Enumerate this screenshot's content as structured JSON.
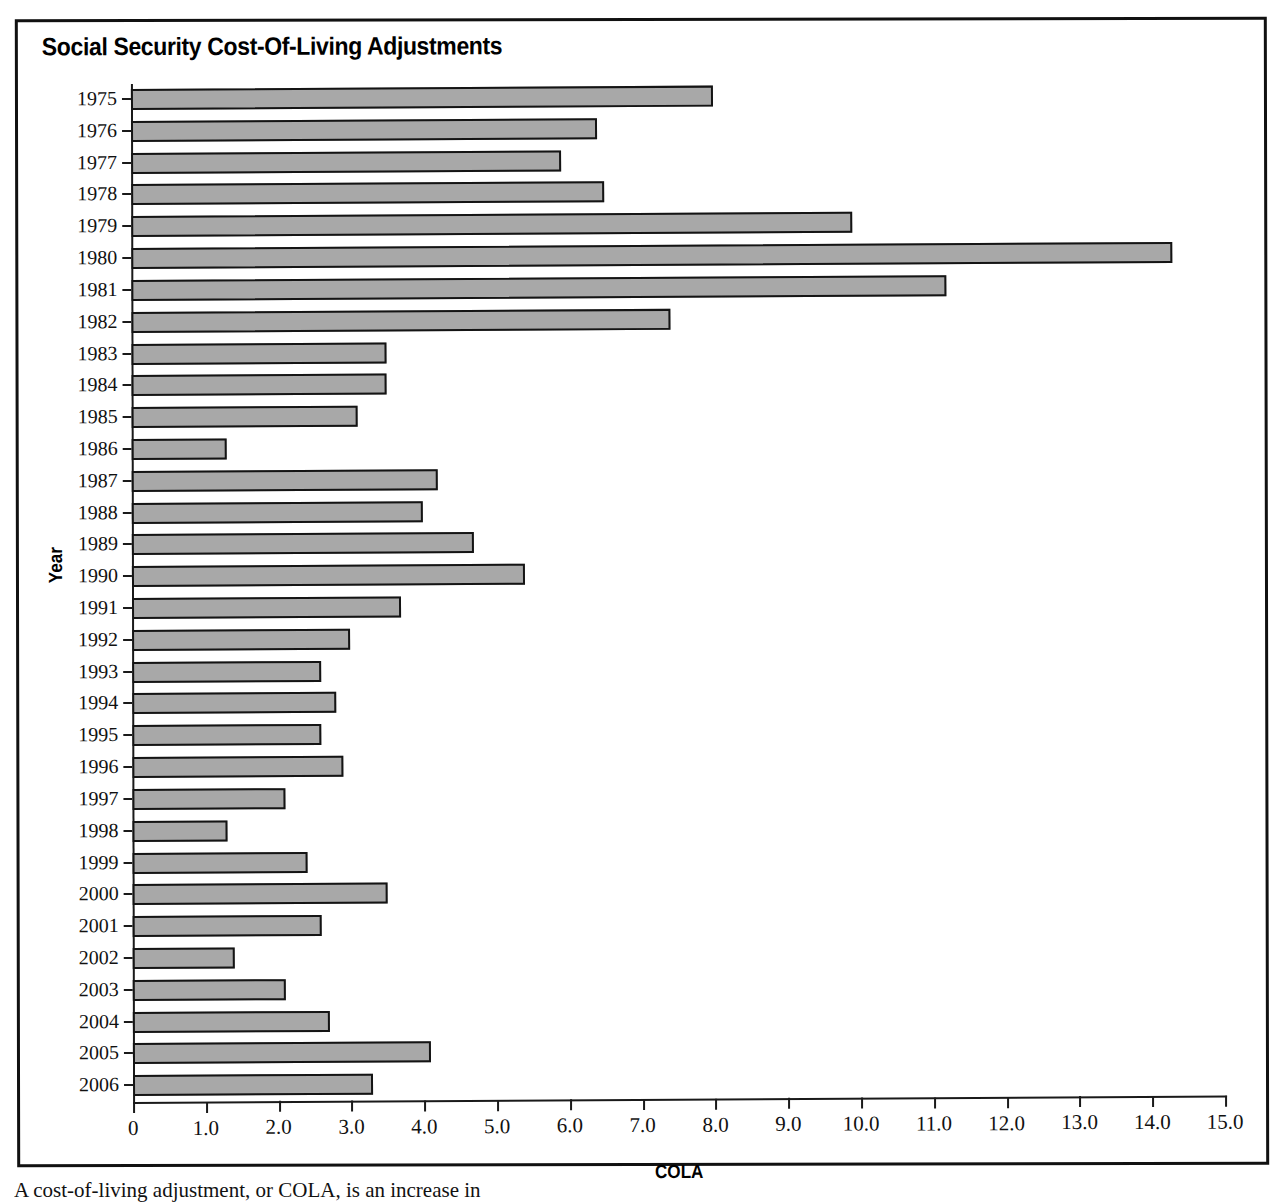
{
  "figure": {
    "title": "Social Security Cost-Of-Living Adjustments",
    "caption": "A cost-of-living adjustment, or COLA, is an increase in"
  },
  "chart_data": {
    "type": "bar",
    "orientation": "horizontal",
    "title": "Social Security Cost-Of-Living Adjustments",
    "xlabel": "COLA",
    "ylabel": "Year",
    "xlim": [
      0,
      15
    ],
    "xticks": [
      "0",
      "1.0",
      "2.0",
      "3.0",
      "4.0",
      "5.0",
      "6.0",
      "7.0",
      "8.0",
      "9.0",
      "10.0",
      "11.0",
      "12.0",
      "13.0",
      "14.0",
      "15.0"
    ],
    "xtick_values": [
      0,
      1,
      2,
      3,
      4,
      5,
      6,
      7,
      8,
      9,
      10,
      11,
      12,
      13,
      14,
      15
    ],
    "grid": false,
    "legend": null,
    "bar_color": "#a8a8a8",
    "bar_edge_color": "#141414",
    "categories": [
      "1975",
      "1976",
      "1977",
      "1978",
      "1979",
      "1980",
      "1981",
      "1982",
      "1983",
      "1984",
      "1985",
      "1986",
      "1987",
      "1988",
      "1989",
      "1990",
      "1991",
      "1992",
      "1993",
      "1994",
      "1995",
      "1996",
      "1997",
      "1998",
      "1999",
      "2000",
      "2001",
      "2002",
      "2003",
      "2004",
      "2005",
      "2006"
    ],
    "values": [
      8.0,
      6.4,
      5.9,
      6.5,
      9.9,
      14.3,
      11.2,
      7.4,
      3.5,
      3.5,
      3.1,
      1.3,
      4.2,
      4.0,
      4.7,
      5.4,
      3.7,
      3.0,
      2.6,
      2.8,
      2.6,
      2.9,
      2.1,
      1.3,
      2.4,
      3.5,
      2.6,
      1.4,
      2.1,
      2.7,
      4.1,
      3.3
    ]
  }
}
